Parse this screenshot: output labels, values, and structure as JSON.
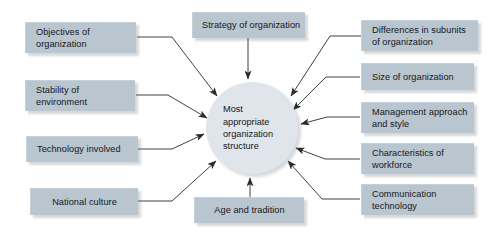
{
  "diagram": {
    "background_color": "#ffffff",
    "box_color": "#b9c5cf",
    "hub_color": "#dfe5ea",
    "connector_color": "#3a3a3a",
    "hub": {
      "id": "hub",
      "lines": [
        "Most",
        "appropriate",
        "organization",
        "structure"
      ],
      "shape": "circle"
    },
    "nodes": [
      {
        "id": "objectives-of-organization",
        "lines": [
          "Objectives of",
          "organization"
        ],
        "side": "left",
        "align": "left"
      },
      {
        "id": "stability-of-environment",
        "lines": [
          "Stability of",
          "environment"
        ],
        "side": "left",
        "align": "left"
      },
      {
        "id": "technology-involved",
        "lines": [
          "Technology involved"
        ],
        "side": "left",
        "align": "left"
      },
      {
        "id": "national-culture",
        "lines": [
          "National culture"
        ],
        "side": "left",
        "align": "left"
      },
      {
        "id": "strategy-of-organization",
        "lines": [
          "Strategy of organization"
        ],
        "side": "top",
        "align": "center"
      },
      {
        "id": "age-and-tradition",
        "lines": [
          "Age and tradition"
        ],
        "side": "bottom",
        "align": "center"
      },
      {
        "id": "differences-in-subunits-of-organization",
        "lines": [
          "Differences in subunits",
          "of organization"
        ],
        "side": "right",
        "align": "left"
      },
      {
        "id": "size-of-organization",
        "lines": [
          "Size of organization"
        ],
        "side": "right",
        "align": "left"
      },
      {
        "id": "management-approach-and-style",
        "lines": [
          "Management approach",
          "and style"
        ],
        "side": "right",
        "align": "left"
      },
      {
        "id": "characteristics-of-workforce",
        "lines": [
          "Characteristics of",
          "workforce"
        ],
        "side": "right",
        "align": "left"
      },
      {
        "id": "communication-technology",
        "lines": [
          "Communication",
          "technology"
        ],
        "side": "right",
        "align": "left"
      }
    ]
  }
}
